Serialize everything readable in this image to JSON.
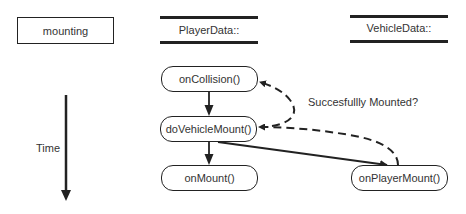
{
  "header": {
    "scenario_label": "mounting",
    "lane_player": "PlayerData::",
    "lane_vehicle": "VehicleData::"
  },
  "axis": {
    "time_label": "Time"
  },
  "nodes": {
    "on_collision": "onCollision()",
    "do_vehicle_mount": "doVehicleMount()",
    "on_mount": "onMount()",
    "on_player_mount": "onPlayerMount()"
  },
  "annotations": {
    "return_label": "Succesfullly Mounted?"
  },
  "colors": {
    "stroke": "#222222",
    "text": "#333333",
    "background": "#ffffff"
  }
}
